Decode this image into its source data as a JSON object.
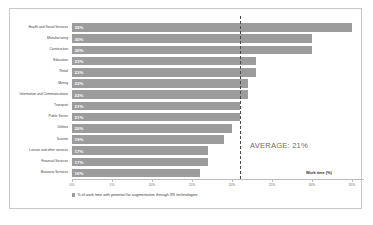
{
  "chart_data": {
    "type": "bar",
    "orientation": "horizontal",
    "title": "",
    "xlabel": "Work time (%)",
    "ylabel": "",
    "xlim": [
      0,
      36.5
    ],
    "xticks": [
      0,
      5,
      10,
      15,
      20,
      25,
      30,
      35
    ],
    "xtick_labels": [
      "0%",
      "5%",
      "10%",
      "15%",
      "20%",
      "25%",
      "30%",
      "35%"
    ],
    "grid": false,
    "legend_position": "bottom-left",
    "legend": [
      "% of work time with potential for augmentation through XR technologies"
    ],
    "categories": [
      "Health and Social Services",
      "Manufacturing",
      "Construction",
      "Education",
      "Retail",
      "Mining",
      "Information and Communications",
      "Transport",
      "Public Sector",
      "Utilities",
      "Tourism",
      "Leisure and other services",
      "Financial Services",
      "Business Services"
    ],
    "values": [
      35,
      30,
      30,
      23,
      23,
      22,
      22,
      21,
      21,
      20,
      19,
      17,
      17,
      16
    ],
    "value_labels": [
      "35%",
      "30%",
      "30%",
      "23%",
      "23%",
      "22%",
      "22%",
      "21%",
      "21%",
      "20%",
      "19%",
      "17%",
      "17%",
      "16%"
    ],
    "annotations": [
      {
        "name": "average-line",
        "label": "AVERAGE: 21%",
        "value": 21
      }
    ],
    "colors": {
      "bar": "#9c9c9c",
      "bar_value_text": "#ffffff",
      "average_line": "#4a4a4a",
      "frame": "#c9c9c9",
      "axis": "#bdbdbd",
      "background": "#ffffff"
    }
  }
}
